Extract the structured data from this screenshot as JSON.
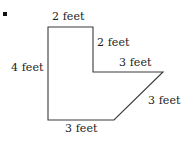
{
  "figure": {
    "bullet_marker": "square-bullet",
    "stroke_color": "#3a3a3a",
    "fill_color": "#ffffff",
    "text_color": "#1c1c1c",
    "unit": "feet",
    "vertices": [
      {
        "name": "top-left",
        "x": 48,
        "y": 27
      },
      {
        "name": "top-right",
        "x": 93,
        "y": 27
      },
      {
        "name": "step-corner",
        "x": 93,
        "y": 72
      },
      {
        "name": "right-tip",
        "x": 163,
        "y": 72
      },
      {
        "name": "diagonal-foot",
        "x": 114,
        "y": 120
      },
      {
        "name": "bottom-left",
        "x": 48,
        "y": 120
      }
    ],
    "path": "M 48 27 L 93 27 L 93 72 L 163 72 L 114 120 L 48 120 Z",
    "labels": {
      "top": "2 feet",
      "right_upper": "2 feet",
      "right_lower": "3 feet",
      "left": "4 feet",
      "diagonal": "3 feet",
      "bottom": "3 feet"
    }
  }
}
